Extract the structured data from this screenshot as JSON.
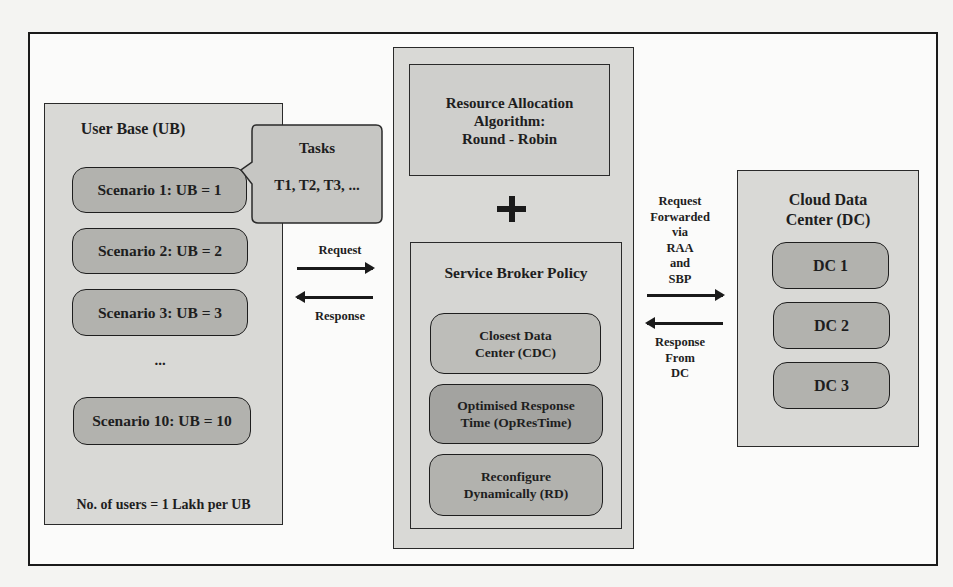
{
  "user_base": {
    "title": "User Base (UB)",
    "scenarios": [
      "Scenario 1: UB = 1",
      "Scenario 2: UB = 2",
      "Scenario 3: UB = 3",
      "...",
      "Scenario 10: UB = 10"
    ],
    "footer": "No. of users = 1 Lakh per UB"
  },
  "tasks": {
    "title": "Tasks",
    "items": "T1, T2, T3, ..."
  },
  "ub_arrows": {
    "request": "Request",
    "response": "Response"
  },
  "center": {
    "raa": {
      "title_line1": "Resource Allocation",
      "title_line2": "Algorithm:",
      "title_line3": "Round - Robin"
    },
    "plus": "+",
    "sbp": {
      "title": "Service Broker Policy",
      "policies": [
        {
          "line1": "Closest Data",
          "line2": "Center (CDC)"
        },
        {
          "line1": "Optimised Response",
          "line2": "Time (OpResTime)"
        },
        {
          "line1": "Reconfigure",
          "line2": "Dynamically (RD)"
        }
      ]
    }
  },
  "dc_arrows": {
    "request_lines": [
      "Request",
      "Forwarded",
      "via",
      "RAA",
      "and",
      "SBP"
    ],
    "response_lines": [
      "Response",
      "From",
      "DC"
    ]
  },
  "data_center": {
    "title_line1": "Cloud Data",
    "title_line2": "Center (DC)",
    "items": [
      "DC 1",
      "DC 2",
      "DC 3"
    ]
  },
  "colors": {
    "frame": "#1a1a1a",
    "panel": "#d9d9d6",
    "pill_light": "#bdbdb9",
    "pill_mid": "#b2b2ae",
    "pill_dark": "#a3a3a0"
  }
}
